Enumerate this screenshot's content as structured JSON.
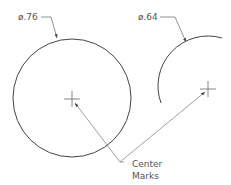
{
  "diagram": {
    "dimensions": [
      {
        "label": "ø.76",
        "target": "full-circle"
      },
      {
        "label": "ø.64",
        "target": "arc"
      }
    ],
    "callout": {
      "line1": "Center",
      "line2": "Marks"
    },
    "colors": {
      "stroke": "#444444",
      "leader": "#888888",
      "text": "#555555"
    }
  }
}
